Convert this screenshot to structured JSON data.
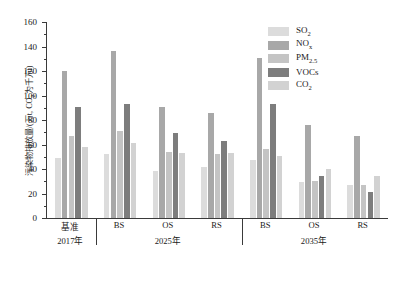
{
  "chart_data": {
    "type": "bar",
    "title": "",
    "xlabel": "",
    "ylabel": "污染物排放量/(万t, CO₂为千万t)",
    "ylim": [
      0,
      160
    ],
    "ytick_step": 20,
    "yticks": [
      "0",
      "20",
      "40",
      "60",
      "80",
      "100",
      "120",
      "140",
      "160"
    ],
    "grid": false,
    "legend_position": "top-right",
    "categories": [
      "基准",
      "BS",
      "OS",
      "RS",
      "BS",
      "OS",
      "RS"
    ],
    "era_groups": [
      {
        "label": "2017年",
        "categories": [
          "基准"
        ]
      },
      {
        "label": "2025年",
        "categories": [
          "BS",
          "OS",
          "RS"
        ]
      },
      {
        "label": "2035年",
        "categories": [
          "BS",
          "OS",
          "RS"
        ]
      }
    ],
    "series": [
      {
        "name": "SO₂",
        "color": "#dcdcdc",
        "values": [
          49,
          52,
          38,
          42,
          47,
          29,
          27
        ]
      },
      {
        "name": "NOₓ",
        "color": "#a8a8a8",
        "values": [
          120,
          136,
          91,
          86,
          131,
          76,
          67
        ]
      },
      {
        "name": "PM₂.₅",
        "color": "#c4c4c4",
        "values": [
          67,
          71,
          54,
          52,
          56,
          30,
          27
        ]
      },
      {
        "name": "VOCs",
        "color": "#7d7d7d",
        "values": [
          91,
          93,
          69,
          63,
          93,
          34,
          21
        ]
      },
      {
        "name": "CO₂",
        "color": "#d2d2d2",
        "values": [
          58,
          61,
          53,
          53,
          51,
          40,
          34
        ]
      }
    ]
  },
  "legend": {
    "items": [
      {
        "label_main": "SO",
        "label_sub": "2",
        "color": "#dcdcdc"
      },
      {
        "label_main": "NO",
        "label_sub": "x",
        "color": "#a8a8a8"
      },
      {
        "label_main": "PM",
        "label_sub": "2.5",
        "color": "#c4c4c4"
      },
      {
        "label_main": "VOCs",
        "label_sub": "",
        "color": "#7d7d7d"
      },
      {
        "label_main": "CO",
        "label_sub": "2",
        "color": "#d2d2d2"
      }
    ]
  },
  "axis": {
    "y_title_main": "污染物排放量/(万t, CO",
    "y_title_sub": "2",
    "y_title_tail": "为千万t)"
  }
}
